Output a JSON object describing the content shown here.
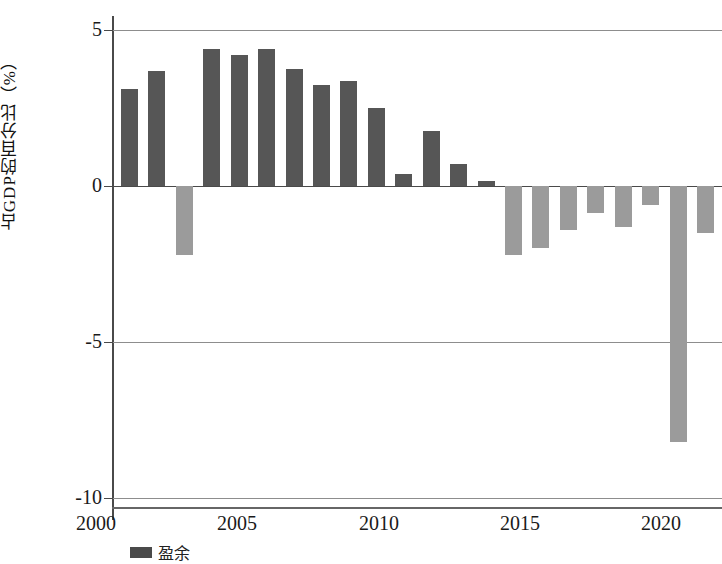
{
  "chart_data": {
    "type": "bar",
    "title": "",
    "subtitle": "",
    "xlabel": "",
    "ylabel": "占GDP的百分比（%）",
    "categories": [
      2000,
      2001,
      2002,
      2003,
      2004,
      2005,
      2006,
      2007,
      2008,
      2009,
      2010,
      2011,
      2012,
      2013,
      2014,
      2015,
      2016,
      2017,
      2018,
      2019,
      2020,
      2021
    ],
    "values": [
      3.1,
      3.7,
      -2.2,
      4.4,
      4.2,
      4.4,
      3.75,
      3.25,
      3.35,
      2.5,
      0.4,
      1.75,
      0.7,
      0.15,
      -2.2,
      -2.0,
      -1.4,
      -0.85,
      -1.3,
      -0.6,
      -8.2,
      -1.5
    ],
    "series": [
      {
        "name": "占GDP的百分比",
        "values": [
          3.1,
          3.7,
          -2.2,
          4.4,
          4.2,
          4.4,
          3.75,
          3.25,
          3.35,
          2.5,
          0.4,
          1.75,
          0.7,
          0.15,
          -2.2,
          -2.0,
          -1.4,
          -0.85,
          -1.3,
          -0.6,
          -8.2,
          -1.5
        ]
      }
    ],
    "ylim": [
      -10,
      5
    ],
    "xlim": [
      1999.4,
      2021.6
    ],
    "ytick_labels": [
      "5",
      "0",
      "-5",
      "-10"
    ],
    "ytick_values": [
      5,
      0,
      -5,
      -10
    ],
    "xtick_labels": [
      "2000",
      "2005",
      "2010",
      "2015",
      "2020"
    ],
    "xtick_values": [
      2000,
      2005,
      2010,
      2015,
      2020
    ],
    "grid": true,
    "grid_axis": "y",
    "legend_position": "bottom-left",
    "colors": {
      "positive_bar": "#565656",
      "negative_bar": "#9b9b9b",
      "axis": "#4a4a4a",
      "gridline": "#8d8d8d",
      "background": "#ffffff",
      "text": "#1a1a1a"
    },
    "annotations": []
  },
  "legend": {
    "items": [
      {
        "label": "盈余",
        "swatch": "positive-bar-swatch"
      },
      {
        "label": "赤字",
        "swatch": "negative-bar-swatch"
      }
    ]
  },
  "axis": {
    "y_title": "占GDP的百分比（%）"
  }
}
